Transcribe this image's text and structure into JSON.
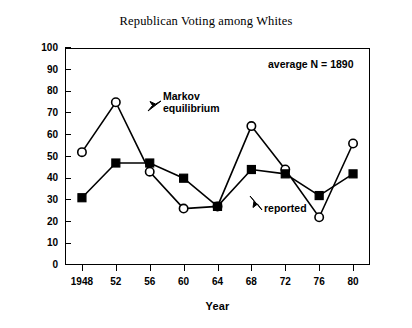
{
  "chart_data": {
    "type": "line",
    "title": "Republican Voting among Whites",
    "xlabel": "Year",
    "ylabel": "Whites Voting Democratic (%)",
    "x": [
      1948,
      1952,
      1956,
      1960,
      1964,
      1968,
      1972,
      1976,
      1980
    ],
    "categories": [
      "1948",
      "52",
      "56",
      "60",
      "64",
      "68",
      "72",
      "76",
      "80"
    ],
    "xlim": [
      1946,
      1982
    ],
    "ylim": [
      0,
      100
    ],
    "ytick_labels": [
      "0",
      "10",
      "20",
      "30",
      "40",
      "50",
      "60",
      "70",
      "80",
      "90",
      "100"
    ],
    "ytick_values": [
      0,
      10,
      20,
      30,
      40,
      50,
      60,
      70,
      80,
      90,
      100
    ],
    "grid": false,
    "legend_position": "none",
    "series": [
      {
        "name": "Markov equilibrium",
        "marker": "open-circle",
        "values": [
          52,
          75,
          43,
          26,
          27,
          64,
          44,
          22,
          56
        ]
      },
      {
        "name": "reported",
        "marker": "filled-square",
        "values": [
          31,
          47,
          47,
          40,
          27,
          44,
          42,
          32,
          42
        ]
      }
    ],
    "annotations": [
      {
        "id": "markov",
        "text": "Markov\nequilibrium",
        "points_to": "1952 open-circle series"
      },
      {
        "id": "reported",
        "text": "reported",
        "points_to": "1968 filled-square series"
      },
      {
        "id": "average_n",
        "text": "average N = 1890"
      }
    ],
    "colors": {
      "line": "#000000",
      "marker_fill_open": "#ffffff",
      "marker_fill_solid": "#000000",
      "background": "#ffffff",
      "axis": "#000000"
    }
  }
}
